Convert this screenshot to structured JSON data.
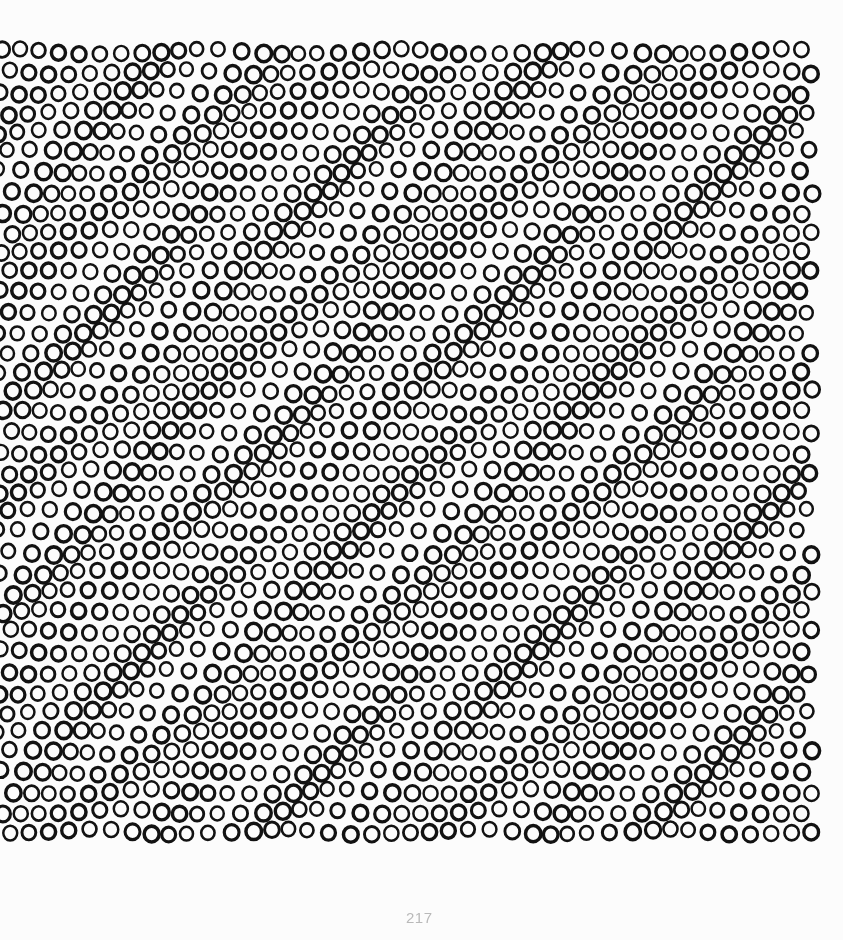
{
  "page": {
    "width": 843,
    "height": 940,
    "background_color": "#fdfdfd",
    "paper_tone": "#fcfcfc"
  },
  "page_number": {
    "label": "217",
    "color": "#b9b9b9",
    "x": 406,
    "y": 910,
    "font_size": 15
  },
  "artwork": {
    "title": "Ring Field",
    "description": "Op-art field of outlined circles in a dense grid with progressive row phase shift producing moire interference bands",
    "ink_color": "#121212",
    "bounds": {
      "x": 0,
      "y": 42,
      "width": 818,
      "height": 797
    },
    "grid": {
      "columns": 41,
      "rows": 40,
      "cell_width": 20.0,
      "cell_height": 20.0,
      "ring_outer_diameter": 17.2,
      "ring_stroke_width": 3.0,
      "row_phase_shift": 0.5,
      "jitter_amplitude_x": 2.6,
      "jitter_amplitude_y": 2.4,
      "size_modulation": 0.14
    },
    "moire": {
      "wave_x_period": 132,
      "wave_y_period": 118,
      "diagonal_period": 96
    }
  },
  "chart_data": {
    "type": "scatter",
    "title": "Ring Field",
    "xlabel": "",
    "ylabel": "",
    "xlim": [
      0,
      818
    ],
    "ylim": [
      42,
      839
    ],
    "grid": false,
    "legend": null,
    "marker": "open-circle",
    "series": [
      {
        "name": "rings",
        "count": 1640,
        "columns": 41,
        "rows": 40,
        "spacing_x": 20.0,
        "spacing_y": 20.0,
        "diameter": 17.2,
        "stroke": 3.0
      }
    ]
  }
}
